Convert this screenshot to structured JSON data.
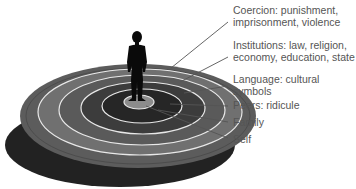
{
  "diagram": {
    "type": "concentric-rings",
    "rings": [
      {
        "id": "coercion",
        "label": "Coercion: punishment, imprisonment, violence",
        "lines": [
          "Coercion: punishment,",
          "imprisonment, violence"
        ],
        "fill": "#5a5a5a"
      },
      {
        "id": "institutions",
        "label": "Institutions: law, religion, economy, education, state",
        "lines": [
          "Institutions: law, religion,",
          "economy, education, state"
        ],
        "fill": "#6e6e6e"
      },
      {
        "id": "language",
        "label": "Language: cultural symbols",
        "lines": [
          "Language: cultural",
          "symbols"
        ],
        "fill": "#555555"
      },
      {
        "id": "peers",
        "label": "Peers: ridicule",
        "lines": [
          "Peers: ridicule"
        ],
        "fill": "#3a3a3a"
      },
      {
        "id": "family",
        "label": "Family",
        "lines": [
          "Family"
        ],
        "fill": "#262626"
      },
      {
        "id": "self",
        "label": "Self",
        "lines": [
          "Self"
        ],
        "fill": "#8a8a8a"
      }
    ],
    "colors": {
      "ring_separator": "#e8e8e8",
      "disc_shadow": "#1e1e1e",
      "figure": "#0a0a0a",
      "leader_line": "#555555",
      "text": "#555555"
    }
  }
}
